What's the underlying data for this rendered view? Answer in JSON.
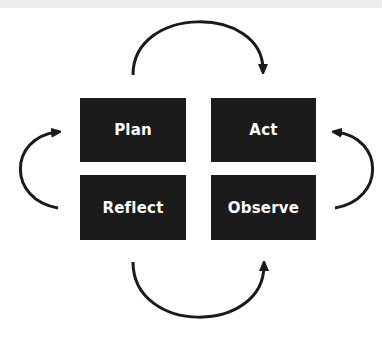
{
  "diagram": {
    "title": "",
    "nodes": [
      {
        "id": "plan",
        "label": "Plan"
      },
      {
        "id": "act",
        "label": "Act"
      },
      {
        "id": "reflect",
        "label": "Reflect"
      },
      {
        "id": "observe",
        "label": "Observe"
      }
    ],
    "edges": [
      {
        "from": "plan",
        "to": "act",
        "shape": "arc-over-top"
      },
      {
        "from": "act",
        "to": "observe",
        "shape": "arc-right"
      },
      {
        "from": "observe",
        "to": "reflect",
        "shape": "arc-under-bottom"
      },
      {
        "from": "reflect",
        "to": "plan",
        "shape": "arc-left"
      }
    ],
    "colors": {
      "box_fill": "#1b1b1b",
      "box_text": "#ffffff",
      "arrow": "#1a1a1a",
      "background": "#ffffff"
    }
  }
}
